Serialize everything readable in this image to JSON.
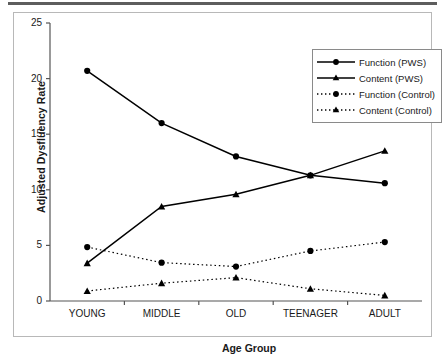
{
  "figure": {
    "top_rule_color": "#5d5d5d",
    "frame_color": "#b8b8b8",
    "background": "#ffffff"
  },
  "chart_data": {
    "type": "line",
    "title": "",
    "xlabel": "Age Group",
    "ylabel": "Adjusted Dysfluency Rate",
    "categories": [
      "YOUNG",
      "MIDDLE",
      "OLD",
      "TEENAGER",
      "ADULT"
    ],
    "ylim": [
      0,
      25
    ],
    "yticks": [
      0,
      5,
      10,
      15,
      20,
      25
    ],
    "grid": false,
    "legend_position": "upper right",
    "series": [
      {
        "name": "Function (PWS)",
        "values": [
          20.7,
          16.0,
          13.0,
          11.3,
          10.6
        ],
        "marker": "circle",
        "linestyle": "solid",
        "color": "#000000"
      },
      {
        "name": "Content (PWS)",
        "values": [
          3.4,
          8.5,
          9.6,
          11.3,
          13.5
        ],
        "marker": "triangle",
        "linestyle": "solid",
        "color": "#000000"
      },
      {
        "name": "Function (Control)",
        "values": [
          4.85,
          3.45,
          3.1,
          4.5,
          5.3
        ],
        "marker": "circle",
        "linestyle": "dotted",
        "color": "#000000"
      },
      {
        "name": "Content (Control)",
        "values": [
          0.9,
          1.6,
          2.1,
          1.1,
          0.5
        ],
        "marker": "triangle",
        "linestyle": "dotted",
        "color": "#000000"
      }
    ]
  },
  "axis": {
    "y_tick_labels": [
      "0",
      "5",
      "10",
      "15",
      "20",
      "25"
    ],
    "x_tick_labels": [
      "YOUNG",
      "MIDDLE",
      "OLD",
      "TEENAGER",
      "ADULT"
    ],
    "y_title": "Adjusted Dysfluency Rate",
    "x_title": "Age Group"
  },
  "legend": {
    "items": [
      {
        "label": "Function (PWS)",
        "marker": "circle",
        "linestyle": "solid"
      },
      {
        "label": "Content (PWS)",
        "marker": "triangle",
        "linestyle": "solid"
      },
      {
        "label": "Function (Control)",
        "marker": "circle",
        "linestyle": "dotted"
      },
      {
        "label": "Content (Control)",
        "marker": "triangle",
        "linestyle": "dotted"
      }
    ]
  }
}
